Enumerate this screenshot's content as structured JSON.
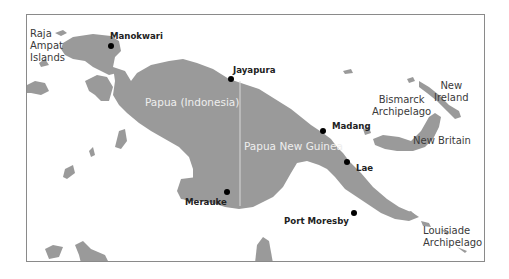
{
  "map": {
    "colors": {
      "land": "#9a9a9a",
      "water": "#ffffff",
      "frame": "#8a8a8a",
      "city_dot": "#000000",
      "border_line": "#d8d8d8"
    },
    "regions": [
      {
        "name": "Papua (Indonesia)"
      },
      {
        "name": "Papua New Guinea"
      }
    ],
    "cities": [
      {
        "name": "Manokwari"
      },
      {
        "name": "Jayapura"
      },
      {
        "name": "Madang"
      },
      {
        "name": "Lae"
      },
      {
        "name": "Merauke"
      },
      {
        "name": "Port Moresby"
      }
    ],
    "features": {
      "raja_ampat": [
        "Raja",
        "Ampat",
        "Islands"
      ],
      "bismarck": [
        "Bismarck",
        "Archipelago"
      ],
      "new_ireland": [
        "New",
        "Ireland"
      ],
      "new_britain": "New Britain",
      "louisiade": [
        "Louisiade",
        "Archipelago"
      ]
    }
  }
}
